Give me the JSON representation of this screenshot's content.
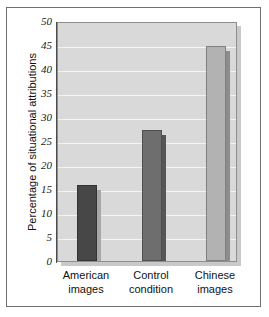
{
  "chart_data": {
    "type": "bar",
    "title": "",
    "xlabel": "",
    "ylabel": "Percentage of situational attributions",
    "categories": [
      "American images",
      "Control condition",
      "Chinese images"
    ],
    "category_lines": [
      [
        "American",
        "images"
      ],
      [
        "Control",
        "condition"
      ],
      [
        "Chinese",
        "images"
      ]
    ],
    "values": [
      15.8,
      27.3,
      44.8
    ],
    "ylim": [
      0,
      50
    ],
    "ytick_step": 5,
    "yticks": [
      0,
      5,
      10,
      15,
      20,
      25,
      30,
      35,
      40,
      45,
      50
    ],
    "ytick_labels": [
      "0",
      "5",
      "10",
      "15",
      "20",
      "25",
      "30",
      "35",
      "40",
      "45",
      "50"
    ],
    "grid": true,
    "grid_axis": "y",
    "legend": "none",
    "bar_colors": [
      "#474747",
      "#6e6e6e",
      "#b2b2b2"
    ],
    "bar_shadow_colors": [
      "#a8a8a8",
      "#565656",
      "#8c8c8c"
    ],
    "plot_background": "#d9d9d9",
    "gridline_color": "#f4f4f4",
    "axis_color": "#4a4a4a",
    "frame_color": "#6f6f6f",
    "figure_background": "#ffffff"
  }
}
